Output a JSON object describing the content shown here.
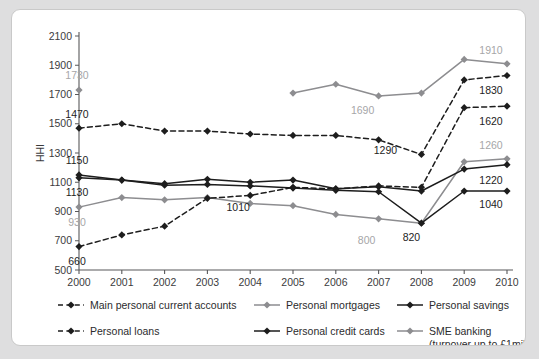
{
  "chart_data": {
    "type": "line",
    "title": "",
    "xlabel": "",
    "ylabel": "HHI",
    "x": [
      2000,
      2001,
      2002,
      2003,
      2004,
      2005,
      2006,
      2007,
      2008,
      2009,
      2010
    ],
    "xtick_labels": [
      "2000",
      "2001",
      "2002",
      "2003",
      "2004",
      "2005",
      "2006",
      "2007",
      "2008",
      "2009",
      "2010"
    ],
    "ytick_labels": [
      "500",
      "700",
      "900",
      "1100",
      "1300",
      "1500",
      "1700",
      "1900",
      "2100"
    ],
    "ytick_values": [
      500,
      700,
      900,
      1100,
      1300,
      1500,
      1700,
      1900,
      2100
    ],
    "ylim": [
      500,
      2100
    ],
    "xlim": [
      2000,
      2010
    ],
    "grid": false,
    "legend_position": "bottom",
    "series": [
      {
        "name": "Main personal current accounts",
        "color": "#1d1d1d",
        "style": "dashed",
        "marker": "diamond",
        "values": [
          1470,
          1500,
          1450,
          1450,
          1430,
          1420,
          1420,
          1390,
          1290,
          1800,
          1830
        ]
      },
      {
        "name": "Personal mortgages",
        "color": "#8d8d90",
        "style": "solid",
        "marker": "diamond",
        "values": [
          930,
          995,
          980,
          995,
          955,
          940,
          880,
          850,
          820,
          1240,
          1260
        ]
      },
      {
        "name": "Personal savings",
        "color": "#1d1d1d",
        "style": "solid",
        "marker": "diamond",
        "values": [
          1150,
          1115,
          1090,
          1120,
          1100,
          1115,
          1055,
          1070,
          1040,
          1190,
          1220
        ]
      },
      {
        "name": "Personal loans",
        "color": "#1d1d1d",
        "style": "dashed",
        "marker": "diamond",
        "values": [
          660,
          740,
          800,
          990,
          1010,
          1065,
          1055,
          1075,
          1065,
          1610,
          1620
        ]
      },
      {
        "name": "Personal credit cards",
        "color": "#1d1d1d",
        "style": "solid",
        "marker": "diamond",
        "values": [
          1130,
          1115,
          1080,
          1085,
          1075,
          1060,
          1045,
          1035,
          820,
          1040,
          1040
        ]
      },
      {
        "name": "SME banking (turnover up to £1mil)",
        "color": "#8d8d90",
        "style": "solid",
        "marker": "diamond",
        "values": [
          1730,
          null,
          null,
          null,
          null,
          1710,
          1770,
          1690,
          1710,
          1940,
          1910
        ]
      }
    ],
    "annotations": [
      {
        "text": "1730",
        "x": 2000,
        "value": 1730,
        "color": "gray",
        "dx": -2,
        "dy": -11
      },
      {
        "text": "1470",
        "x": 2000,
        "value": 1470,
        "color": "black",
        "dx": -2,
        "dy": -10
      },
      {
        "text": "1150",
        "x": 2000,
        "value": 1150,
        "color": "black",
        "dx": -2,
        "dy": -11
      },
      {
        "text": "1130",
        "x": 2000,
        "value": 1130,
        "color": "black",
        "dx": -2,
        "dy": 18
      },
      {
        "text": "930",
        "x": 2000,
        "value": 930,
        "color": "gray",
        "dx": -2,
        "dy": 19
      },
      {
        "text": "660",
        "x": 2000,
        "value": 660,
        "color": "black",
        "dx": -2,
        "dy": 18
      },
      {
        "text": "1010",
        "x": 2004,
        "value": 1010,
        "color": "black",
        "dx": -12,
        "dy": 16
      },
      {
        "text": "1690",
        "x": 2007,
        "value": 1690,
        "color": "gray",
        "dx": -16,
        "dy": 18
      },
      {
        "text": "1290",
        "x": 2008,
        "value": 1290,
        "color": "black",
        "dx": -36,
        "dy": 0
      },
      {
        "text": "800",
        "x": 2007,
        "value": 800,
        "color": "gray",
        "dx": -12,
        "dy": 18
      },
      {
        "text": "820",
        "x": 2008,
        "value": 820,
        "color": "black",
        "dx": -10,
        "dy": 18
      },
      {
        "text": "1910",
        "x": 2010,
        "value": 1910,
        "color": "gray",
        "dx": -16,
        "dy": -10
      },
      {
        "text": "1830",
        "x": 2010,
        "value": 1830,
        "color": "black",
        "dx": -16,
        "dy": 19
      },
      {
        "text": "1620",
        "x": 2010,
        "value": 1620,
        "color": "black",
        "dx": -16,
        "dy": 19
      },
      {
        "text": "1260",
        "x": 2010,
        "value": 1260,
        "color": "gray",
        "dx": -16,
        "dy": -10
      },
      {
        "text": "1220",
        "x": 2010,
        "value": 1220,
        "color": "black",
        "dx": -16,
        "dy": 19
      },
      {
        "text": "1040",
        "x": 2010,
        "value": 1040,
        "color": "black",
        "dx": -16,
        "dy": 17
      }
    ]
  },
  "legend": {
    "items": [
      {
        "label": "Main personal current accounts",
        "color": "#1d1d1d",
        "style": "dashed"
      },
      {
        "label": "Personal mortgages",
        "color": "#8d8d90",
        "style": "solid"
      },
      {
        "label": "Personal savings",
        "color": "#1d1d1d",
        "style": "solid"
      },
      {
        "label": "Personal loans",
        "color": "#1d1d1d",
        "style": "dashed"
      },
      {
        "label": "Personal credit cards",
        "color": "#1d1d1d",
        "style": "solid"
      },
      {
        "label": "SME banking",
        "sublabel": "(turnover up to £1mil)",
        "color": "#8d8d90",
        "style": "solid"
      }
    ]
  },
  "colors": {
    "page_background": "#dededf",
    "card_background": "#ffffff",
    "axis": "#58585a",
    "dark_series": "#1d1d1d",
    "gray_series": "#8d8d90",
    "gray_label": "#a6a6a8"
  }
}
